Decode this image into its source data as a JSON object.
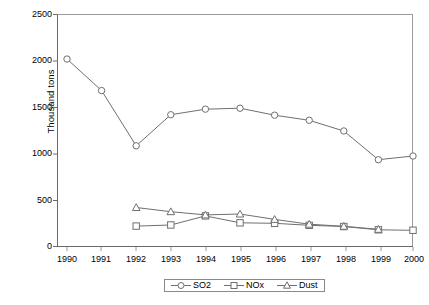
{
  "chart_data": {
    "type": "line",
    "title": "",
    "xlabel": "",
    "ylabel": "Thousand tons",
    "categories": [
      "1990",
      "1991",
      "1992",
      "1993",
      "1994",
      "1995",
      "1996",
      "1997",
      "1998",
      "1999",
      "2000"
    ],
    "x": [
      1990,
      1991,
      1992,
      1993,
      1994,
      1995,
      1996,
      1997,
      1998,
      1999,
      2000
    ],
    "ylim": [
      0,
      2500
    ],
    "yticks": [
      0,
      500,
      1000,
      1500,
      2000,
      2500
    ],
    "ytick_labels": [
      "0",
      "500",
      "1000",
      "1500",
      "2000",
      "2500"
    ],
    "grid": false,
    "legend_position": "bottom-center",
    "series": [
      {
        "name": "SO2",
        "marker": "circle",
        "color": "#6f6f6f",
        "values": [
          2020,
          1680,
          1085,
          1420,
          1480,
          1490,
          1415,
          1360,
          1245,
          935,
          975
        ]
      },
      {
        "name": "NOx",
        "marker": "square",
        "color": "#6f6f6f",
        "values": [
          null,
          null,
          220,
          232,
          330,
          255,
          250,
          228,
          215,
          180,
          175
        ]
      },
      {
        "name": "Dust",
        "marker": "triangle",
        "color": "#6f6f6f",
        "values": [
          null,
          null,
          420,
          375,
          340,
          350,
          292,
          240,
          218,
          185,
          null
        ]
      }
    ]
  },
  "axes": {
    "y_title": "Thousand tons",
    "y_labels": [
      "2500",
      "2000",
      "1500",
      "1000",
      "500",
      "0"
    ],
    "x_labels": [
      "1990",
      "1991",
      "1992",
      "1993",
      "1994",
      "1995",
      "1996",
      "1997",
      "1998",
      "1999",
      "2000"
    ]
  },
  "legend": {
    "items": [
      {
        "label": "SO2",
        "marker": "circle-marker-icon"
      },
      {
        "label": "NOx",
        "marker": "square-marker-icon"
      },
      {
        "label": "Dust",
        "marker": "triangle-marker-icon"
      }
    ]
  },
  "colors": {
    "line": "#6f6f6f",
    "axis": "#7a7a7a",
    "marker_fill": "#ffffff",
    "text": "#000000"
  }
}
